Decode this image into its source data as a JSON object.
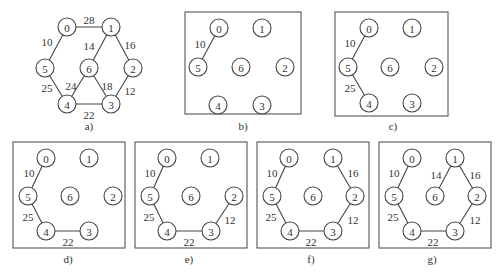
{
  "figure": {
    "node_radius": 9,
    "panels": [
      {
        "id": "a",
        "caption": "a)",
        "framed": false,
        "caption_pos": [
          89,
          126
        ],
        "nodes": [
          {
            "label": "0",
            "x": 67,
            "y": 27
          },
          {
            "label": "1",
            "x": 111,
            "y": 27
          },
          {
            "label": "5",
            "x": 45,
            "y": 68
          },
          {
            "label": "6",
            "x": 89,
            "y": 68
          },
          {
            "label": "2",
            "x": 133,
            "y": 68
          },
          {
            "label": "4",
            "x": 67,
            "y": 104
          },
          {
            "label": "3",
            "x": 111,
            "y": 104
          }
        ],
        "edges": [
          {
            "from": "0",
            "to": "1",
            "weight": "28",
            "label_pos": [
              89,
              20
            ]
          },
          {
            "from": "0",
            "to": "5",
            "weight": "10",
            "label_pos": [
              47,
              42
            ]
          },
          {
            "from": "1",
            "to": "6",
            "weight": "14",
            "label_pos": [
              89,
              46
            ]
          },
          {
            "from": "1",
            "to": "2",
            "weight": "16",
            "label_pos": [
              130,
              45
            ]
          },
          {
            "from": "5",
            "to": "4",
            "weight": "25",
            "label_pos": [
              47,
              88
            ]
          },
          {
            "from": "6",
            "to": "4",
            "weight": "24",
            "label_pos": [
              71,
              86
            ]
          },
          {
            "from": "6",
            "to": "3",
            "weight": "18",
            "label_pos": [
              107,
              86
            ]
          },
          {
            "from": "2",
            "to": "3",
            "weight": "12",
            "label_pos": [
              130,
              91
            ]
          },
          {
            "from": "4",
            "to": "3",
            "weight": "22",
            "label_pos": [
              89,
              115
            ]
          }
        ]
      },
      {
        "id": "b",
        "caption": "b)",
        "framed": true,
        "frame": [
          185,
          12,
          116,
          102
        ],
        "caption_pos": [
          243,
          126
        ],
        "nodes": [
          {
            "label": "0",
            "x": 219,
            "y": 28
          },
          {
            "label": "1",
            "x": 262,
            "y": 28
          },
          {
            "label": "5",
            "x": 198,
            "y": 67
          },
          {
            "label": "6",
            "x": 241,
            "y": 67
          },
          {
            "label": "2",
            "x": 285,
            "y": 67
          },
          {
            "label": "4",
            "x": 218,
            "y": 105
          },
          {
            "label": "3",
            "x": 262,
            "y": 105
          }
        ],
        "edges": [
          {
            "from": "0",
            "to": "5",
            "weight": "10",
            "label_pos": [
              200,
              44
            ]
          }
        ]
      },
      {
        "id": "c",
        "caption": "c)",
        "framed": true,
        "frame": [
          335,
          12,
          113,
          104
        ],
        "caption_pos": [
          393,
          126
        ],
        "nodes": [
          {
            "label": "0",
            "x": 369,
            "y": 28
          },
          {
            "label": "1",
            "x": 412,
            "y": 28
          },
          {
            "label": "5",
            "x": 348,
            "y": 67
          },
          {
            "label": "6",
            "x": 390,
            "y": 67
          },
          {
            "label": "2",
            "x": 434,
            "y": 67
          },
          {
            "label": "4",
            "x": 369,
            "y": 103
          },
          {
            "label": "3",
            "x": 412,
            "y": 103
          }
        ],
        "edges": [
          {
            "from": "0",
            "to": "5",
            "weight": "10",
            "label_pos": [
              350,
              43
            ]
          },
          {
            "from": "5",
            "to": "4",
            "weight": "25",
            "label_pos": [
              350,
              88
            ]
          }
        ]
      },
      {
        "id": "d",
        "caption": "d)",
        "framed": true,
        "frame": [
          13,
          142,
          112,
          106
        ],
        "caption_pos": [
          68,
          259
        ],
        "nodes": [
          {
            "label": "0",
            "x": 46,
            "y": 158
          },
          {
            "label": "1",
            "x": 89,
            "y": 158
          },
          {
            "label": "5",
            "x": 28,
            "y": 196
          },
          {
            "label": "6",
            "x": 70,
            "y": 196
          },
          {
            "label": "2",
            "x": 113,
            "y": 196
          },
          {
            "label": "4",
            "x": 46,
            "y": 231
          },
          {
            "label": "3",
            "x": 89,
            "y": 231
          }
        ],
        "edges": [
          {
            "from": "0",
            "to": "5",
            "weight": "10",
            "label_pos": [
              29,
              173
            ]
          },
          {
            "from": "5",
            "to": "4",
            "weight": "25",
            "label_pos": [
              28,
              217
            ]
          },
          {
            "from": "4",
            "to": "3",
            "weight": "22",
            "label_pos": [
              68,
              242
            ]
          }
        ]
      },
      {
        "id": "e",
        "caption": "e)",
        "framed": true,
        "frame": [
          135,
          142,
          112,
          106
        ],
        "caption_pos": [
          189,
          259
        ],
        "nodes": [
          {
            "label": "0",
            "x": 167,
            "y": 158
          },
          {
            "label": "1",
            "x": 210,
            "y": 158
          },
          {
            "label": "5",
            "x": 150,
            "y": 196
          },
          {
            "label": "6",
            "x": 191,
            "y": 196
          },
          {
            "label": "2",
            "x": 234,
            "y": 196
          },
          {
            "label": "4",
            "x": 167,
            "y": 231
          },
          {
            "label": "3",
            "x": 211,
            "y": 231
          }
        ],
        "edges": [
          {
            "from": "0",
            "to": "5",
            "weight": "10",
            "label_pos": [
              150,
              173
            ]
          },
          {
            "from": "5",
            "to": "4",
            "weight": "25",
            "label_pos": [
              149,
              217
            ]
          },
          {
            "from": "4",
            "to": "3",
            "weight": "22",
            "label_pos": [
              189,
              242
            ]
          },
          {
            "from": "2",
            "to": "3",
            "weight": "12",
            "label_pos": [
              230,
              220
            ]
          }
        ]
      },
      {
        "id": "f",
        "caption": "f)",
        "framed": true,
        "frame": [
          257,
          142,
          112,
          106
        ],
        "caption_pos": [
          311,
          259
        ],
        "nodes": [
          {
            "label": "0",
            "x": 289,
            "y": 158
          },
          {
            "label": "1",
            "x": 333,
            "y": 158
          },
          {
            "label": "5",
            "x": 272,
            "y": 196
          },
          {
            "label": "6",
            "x": 313,
            "y": 196
          },
          {
            "label": "2",
            "x": 355,
            "y": 196
          },
          {
            "label": "4",
            "x": 290,
            "y": 231
          },
          {
            "label": "3",
            "x": 333,
            "y": 231
          }
        ],
        "edges": [
          {
            "from": "0",
            "to": "5",
            "weight": "10",
            "label_pos": [
              272,
              173
            ]
          },
          {
            "from": "1",
            "to": "2",
            "weight": "16",
            "label_pos": [
              353,
              173
            ]
          },
          {
            "from": "5",
            "to": "4",
            "weight": "25",
            "label_pos": [
              271,
              217
            ]
          },
          {
            "from": "4",
            "to": "3",
            "weight": "22",
            "label_pos": [
              311,
              242
            ]
          },
          {
            "from": "2",
            "to": "3",
            "weight": "12",
            "label_pos": [
              353,
              220
            ]
          }
        ]
      },
      {
        "id": "g",
        "caption": "g)",
        "framed": true,
        "frame": [
          379,
          142,
          112,
          106
        ],
        "caption_pos": [
          432,
          259
        ],
        "nodes": [
          {
            "label": "0",
            "x": 412,
            "y": 158
          },
          {
            "label": "1",
            "x": 455,
            "y": 158
          },
          {
            "label": "5",
            "x": 394,
            "y": 196
          },
          {
            "label": "6",
            "x": 435,
            "y": 196
          },
          {
            "label": "2",
            "x": 477,
            "y": 196
          },
          {
            "label": "4",
            "x": 412,
            "y": 231
          },
          {
            "label": "3",
            "x": 455,
            "y": 231
          }
        ],
        "edges": [
          {
            "from": "0",
            "to": "5",
            "weight": "10",
            "label_pos": [
              394,
              173
            ]
          },
          {
            "from": "1",
            "to": "6",
            "weight": "14",
            "label_pos": [
              436,
              175
            ]
          },
          {
            "from": "1",
            "to": "2",
            "weight": "16",
            "label_pos": [
              475,
              175
            ]
          },
          {
            "from": "5",
            "to": "4",
            "weight": "25",
            "label_pos": [
              393,
              217
            ]
          },
          {
            "from": "4",
            "to": "3",
            "weight": "22",
            "label_pos": [
              433,
              242
            ]
          },
          {
            "from": "2",
            "to": "3",
            "weight": "12",
            "label_pos": [
              475,
              220
            ]
          }
        ]
      }
    ]
  }
}
